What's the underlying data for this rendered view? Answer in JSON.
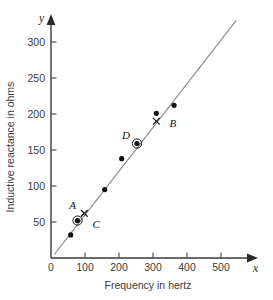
{
  "chart_data": {
    "type": "scatter",
    "title": "",
    "xlabel": "Frequency in hertz",
    "ylabel": "Inductive reactance in ohms",
    "x_axis_variable": "x",
    "y_axis_variable": "y",
    "xlim": [
      0,
      560
    ],
    "ylim": [
      0,
      330
    ],
    "xticks": [
      0,
      100,
      200,
      300,
      400,
      500
    ],
    "yticks": [
      0,
      50,
      100,
      150,
      200,
      250,
      300
    ],
    "xtick_labels": [
      "0",
      "100",
      "200",
      "300",
      "400",
      "500"
    ],
    "ytick_labels": [
      "0",
      "50",
      "100",
      "150",
      "200",
      "250",
      "300"
    ],
    "grid": false,
    "legend": "none",
    "series": [
      {
        "name": "measured data",
        "marker": "filled-circle",
        "x": [
          58,
          78,
          158,
          208,
          253,
          310,
          362
        ],
        "y": [
          32,
          52,
          95,
          138,
          159,
          201,
          212
        ]
      }
    ],
    "trend_line": {
      "name": "line of best fit",
      "x_start": 10,
      "y_start": 5,
      "x_end": 545,
      "y_end": 330,
      "slope": 0.6075,
      "intercept": -1.0
    },
    "annotations": [
      {
        "label": "A",
        "marker": "cross",
        "x": 98,
        "y": 62,
        "label_dx": -15,
        "label_dy": -4
      },
      {
        "label": "B",
        "marker": "cross",
        "x": 310,
        "y": 190,
        "label_dx": 13,
        "label_dy": 6
      },
      {
        "label": "C",
        "marker": "circled-point",
        "x": 78,
        "y": 52,
        "label_dx": 15,
        "label_dy": 7
      },
      {
        "label": "D",
        "marker": "circled-point",
        "x": 253,
        "y": 159,
        "label_dx": -15,
        "label_dy": -5
      }
    ]
  }
}
